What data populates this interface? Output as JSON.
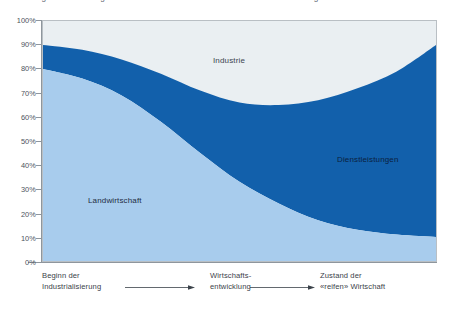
{
  "caption": {
    "text": "Abbildung 3  Veränderung der wirtschaftlichen Struktur im Verlauf der Entwicklung"
  },
  "chart_data": {
    "type": "area",
    "title": "",
    "xlabel": "",
    "ylabel": "",
    "ylim": [
      0,
      100
    ],
    "grid": false,
    "stacked": true,
    "legend_position": "in-plot",
    "y_ticks": [
      "0%",
      "10%",
      "20%",
      "30%",
      "40%",
      "50%",
      "60%",
      "70%",
      "80%",
      "90%",
      "100%"
    ],
    "y_tick_values": [
      0,
      10,
      20,
      30,
      40,
      50,
      60,
      70,
      80,
      90,
      100
    ],
    "x": [
      0,
      10,
      20,
      30,
      40,
      50,
      60,
      70,
      80,
      90,
      100
    ],
    "x_axis_stages": [
      "Beginn der Industrialisierung",
      "Wirtschaftsentwicklung",
      "Zustand der «reifen» Wirtschaft"
    ],
    "series": [
      {
        "name": "Landwirtschaft",
        "color": "#a8cced",
        "values": [
          80,
          76,
          69,
          58,
          45,
          33,
          24,
          17,
          13,
          11,
          10
        ],
        "note": "bottom band, cumulative top boundary"
      },
      {
        "name": "Dienstleistungen",
        "color": "#1260ab",
        "values": [
          10,
          12,
          15,
          20,
          26,
          33,
          41,
          50,
          59,
          68,
          80
        ],
        "cumulative_top": [
          90,
          88,
          84,
          78,
          71,
          66,
          65,
          67,
          72,
          79,
          90
        ],
        "note": "middle band"
      },
      {
        "name": "Industrie",
        "color": "#eaeff2",
        "values": [
          10,
          12,
          16,
          22,
          29,
          34,
          35,
          33,
          28,
          21,
          10
        ],
        "cumulative_top": [
          100,
          100,
          100,
          100,
          100,
          100,
          100,
          100,
          100,
          100,
          100
        ],
        "note": "top band, fills to 100%"
      }
    ]
  },
  "axis": {
    "left_stage_line1": "Beginn der",
    "left_stage_line2": "Industrialisierung",
    "mid_stage_line1": "Wirtschafts-",
    "mid_stage_line2": "entwicklung",
    "right_stage_line1": "Zustand der",
    "right_stage_line2": "«reifen» Wirtschaft"
  },
  "labels": {
    "industrie": "Industrie",
    "landwirtschaft": "Landwirtschaft",
    "dienstleistungen": "Dienstleistungen"
  },
  "colors": {
    "band_bottom": "#a8cced",
    "band_middle": "#1260ab",
    "band_top": "#eaeff2",
    "axis": "#8e969d",
    "frame": "#b9bfc4",
    "text": "#3b424a"
  }
}
